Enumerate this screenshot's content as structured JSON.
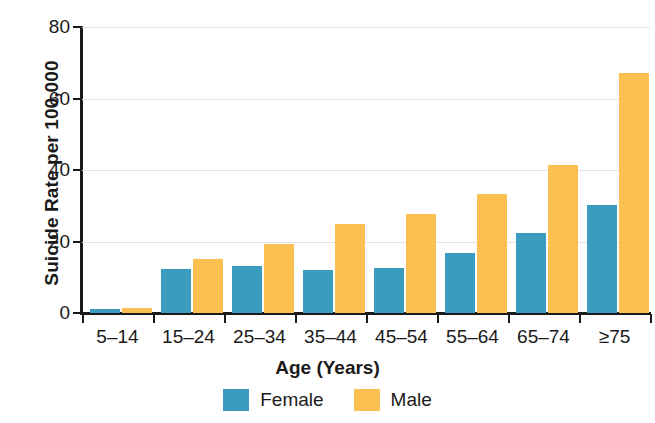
{
  "chart_data": {
    "type": "bar",
    "title": "",
    "xlabel": "Age (Years)",
    "ylabel": "Suicide Rate per 100,000",
    "categories": [
      "5–14",
      "15–24",
      "25–34",
      "35–44",
      "45–54",
      "55–64",
      "65–74",
      "≥75"
    ],
    "series": [
      {
        "name": "Female",
        "color": "#3a9cbe",
        "values": [
          1.0,
          12.3,
          13.1,
          12.0,
          12.7,
          16.7,
          22.4,
          30.2
        ]
      },
      {
        "name": "Male",
        "color": "#fbbf52",
        "values": [
          1.5,
          15.0,
          19.2,
          24.8,
          27.8,
          33.3,
          41.5,
          67.0
        ]
      }
    ],
    "ylim": [
      0,
      80
    ],
    "yticks": [
      0,
      20,
      40,
      60,
      80
    ],
    "ytick_labels": [
      "0",
      "20",
      "40",
      "60",
      "80"
    ],
    "grid": "horizontal",
    "legend_position": "bottom-center",
    "legend_entries": [
      "Female",
      "Male"
    ]
  }
}
